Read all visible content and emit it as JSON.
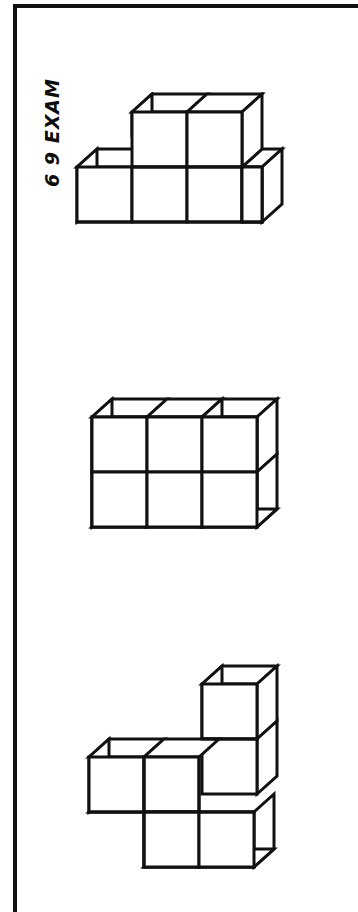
{
  "page": {
    "background_color": "#ffffff",
    "ink_color": "#111111",
    "width": 358,
    "height": 912,
    "margin_text": "6 9 EXAM"
  },
  "frame": {
    "rule_color": "#111111",
    "top_rule_thickness": 4,
    "left_rule_thickness": 4,
    "panel_border_color": "#333333",
    "panel_border_thickness": 1.5
  },
  "figures": [
    {
      "id": "figure-top",
      "name": "isometric-block-figure-1",
      "cube_count": 6,
      "description": "Stepped arrangement of unit cubes in oblique projection"
    },
    {
      "id": "figure-middle",
      "name": "isometric-block-figure-2",
      "cube_count": 6,
      "description": "Two-by-two block with a two-high column on the right"
    },
    {
      "id": "figure-bottom",
      "name": "isometric-block-figure-3",
      "cube_count": 6,
      "description": "L-shaped arrangement with a two-high column at the upper right"
    }
  ]
}
